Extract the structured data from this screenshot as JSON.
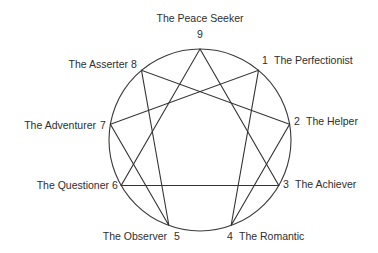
{
  "diagram": {
    "type": "enneagram",
    "circle": {
      "cx": 200,
      "cy": 140,
      "r": 91
    },
    "colors": {
      "lines": "#333333",
      "text": "#2e2e2e",
      "background": "#ffffff"
    },
    "points": [
      {
        "number": "9",
        "name": "The Peace Seeker"
      },
      {
        "number": "1",
        "name": "The Perfectionist"
      },
      {
        "number": "2",
        "name": "The Helper"
      },
      {
        "number": "3",
        "name": "The Achiever"
      },
      {
        "number": "4",
        "name": "The Romantic"
      },
      {
        "number": "5",
        "name": "The Observer"
      },
      {
        "number": "6",
        "name": "The Questioner"
      },
      {
        "number": "7",
        "name": "The Adventurer"
      },
      {
        "number": "8",
        "name": "The Asserter"
      }
    ],
    "triangle": [
      "3",
      "6",
      "9"
    ],
    "hexad": [
      "1",
      "4",
      "2",
      "8",
      "5",
      "7",
      "1"
    ]
  }
}
